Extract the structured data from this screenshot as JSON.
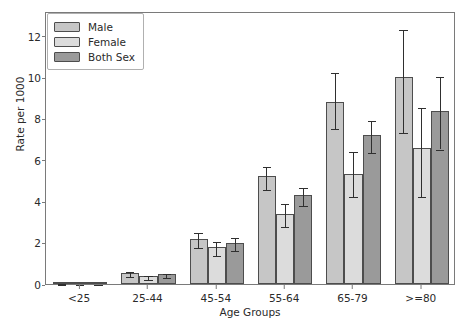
{
  "chart_data": {
    "type": "bar",
    "title": "",
    "xlabel": "Age Groups",
    "ylabel": "Rate per 1000",
    "categories": [
      "<25",
      "25-44",
      "45-54",
      "55-64",
      "65-79",
      ">=80"
    ],
    "ylim": [
      0,
      13.2
    ],
    "yticks": [
      0,
      2,
      4,
      6,
      8,
      10,
      12
    ],
    "ytick_labels": [
      "0",
      "2",
      "4",
      "6",
      "8",
      "10",
      "12"
    ],
    "grid": false,
    "legend_position": "upper left",
    "error_bars": true,
    "series": [
      {
        "name": "Male",
        "color": "#c6c6c6",
        "values": [
          0.06,
          0.55,
          2.2,
          5.2,
          8.8,
          10.0
        ],
        "err_low": [
          0.02,
          0.12,
          0.35,
          0.55,
          1.2,
          2.6
        ],
        "err_high": [
          0.02,
          0.12,
          0.35,
          0.55,
          1.5,
          2.4
        ]
      },
      {
        "name": "Female",
        "color": "#dcdcdc",
        "values": [
          0.05,
          0.4,
          1.8,
          3.4,
          5.3,
          6.6
        ],
        "err_low": [
          0.02,
          0.1,
          0.35,
          0.55,
          1.0,
          2.3
        ],
        "err_high": [
          0.02,
          0.1,
          0.35,
          0.55,
          1.2,
          2.0
        ]
      },
      {
        "name": "Both Sex",
        "color": "#9a9a9a",
        "values": [
          0.05,
          0.47,
          2.0,
          4.3,
          7.2,
          8.35
        ],
        "err_low": [
          0.02,
          0.09,
          0.3,
          0.45,
          0.75,
          1.75
        ],
        "err_high": [
          0.02,
          0.09,
          0.3,
          0.45,
          0.8,
          1.75
        ]
      }
    ]
  },
  "legend": {
    "items": [
      {
        "label": "Male",
        "color": "#c6c6c6"
      },
      {
        "label": "Female",
        "color": "#dcdcdc"
      },
      {
        "label": "Both Sex",
        "color": "#9a9a9a"
      }
    ]
  },
  "axes": {
    "y_title": "Rate per 1000",
    "x_title": "Age Groups"
  }
}
